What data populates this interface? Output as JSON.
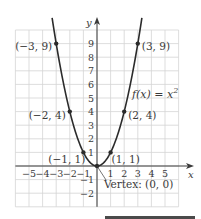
{
  "chart_data": {
    "type": "line",
    "title": "",
    "function_label": "f(x) = x",
    "function_exponent": "2",
    "xlabel": "x",
    "ylabel": "y",
    "xlim": [
      -6,
      6
    ],
    "ylim": [
      -3,
      10
    ],
    "grid": true,
    "x_ticks": [
      -5,
      -4,
      -3,
      -2,
      -1,
      1,
      2,
      3,
      4,
      5
    ],
    "x_tick_labels": [
      "−5",
      "−4",
      "−3",
      "−2",
      "−1",
      "1",
      "2",
      "3",
      "4",
      "5"
    ],
    "y_ticks": [
      -2,
      -1,
      1,
      2,
      3,
      4,
      5,
      6,
      7,
      8,
      9
    ],
    "y_tick_labels": [
      "−2",
      "−1",
      "1",
      "2",
      "3",
      "4",
      "5",
      "6",
      "7",
      "8",
      "9"
    ],
    "series": [
      {
        "name": "f(x) = x^2",
        "x": [
          -3.3,
          -3,
          -2,
          -1,
          0,
          1,
          2,
          3,
          3.3
        ],
        "y": [
          10.89,
          9,
          4,
          1,
          0,
          1,
          4,
          9,
          10.89
        ]
      }
    ],
    "points": [
      {
        "x": -3,
        "y": 9,
        "label": "(−3, 9)",
        "side": "left"
      },
      {
        "x": 3,
        "y": 9,
        "label": "(3, 9)",
        "side": "right"
      },
      {
        "x": -2,
        "y": 4,
        "label": "(−2, 4)",
        "side": "left"
      },
      {
        "x": 2,
        "y": 4,
        "label": "(2, 4)",
        "side": "right"
      },
      {
        "x": -1,
        "y": 1,
        "label": "(−1, 1)",
        "side": "left"
      },
      {
        "x": 1,
        "y": 1,
        "label": "(1, 1)",
        "side": "right"
      },
      {
        "x": 0,
        "y": 0,
        "label": "",
        "side": "none"
      }
    ],
    "annotations": [
      {
        "text": "Vertex: (0, 0)",
        "x": 0,
        "y": 0
      }
    ],
    "colors": {
      "curve": "#2b2b2b",
      "grid": "#d4d4d4",
      "axis": "#3a3a3a",
      "text": "#3a3a3a",
      "bar": "#4a4a4a"
    }
  }
}
